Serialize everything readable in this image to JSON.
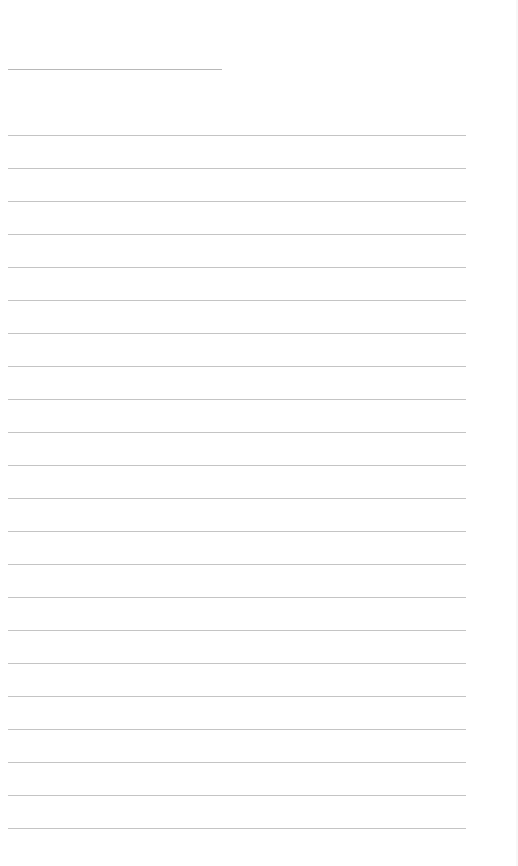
{
  "page": {
    "type": "blank lined paper",
    "background_color": "#ffffff",
    "line_color": "#c4c4c4",
    "title_line": {
      "present": true,
      "text": ""
    },
    "ruled_lines": {
      "count": 22,
      "first_y": 135,
      "spacing": 33,
      "texts": [
        "",
        "",
        "",
        "",
        "",
        "",
        "",
        "",
        "",
        "",
        "",
        "",
        "",
        "",
        "",
        "",
        "",
        "",
        "",
        "",
        "",
        ""
      ]
    }
  }
}
